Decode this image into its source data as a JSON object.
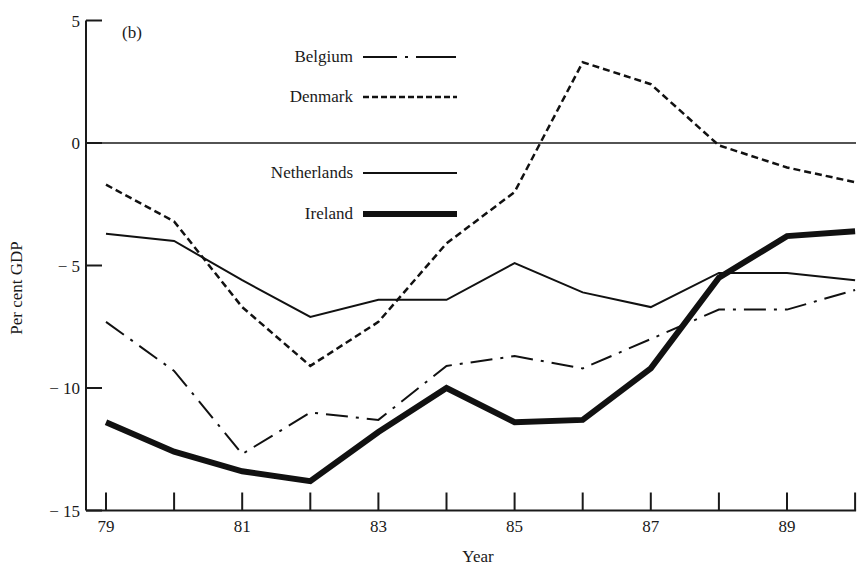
{
  "chart_data": {
    "type": "line",
    "panel_label": "(b)",
    "title": "",
    "xlabel": "Year",
    "ylabel": "Per cent GDP",
    "ylim": [
      -15,
      5
    ],
    "xlim": [
      79,
      90
    ],
    "yticks": [
      5,
      0,
      -5,
      -10,
      -15
    ],
    "ytick_labels": [
      "5",
      "0",
      "− 5",
      "− 10",
      "− 15"
    ],
    "xticks": [
      79,
      80,
      81,
      82,
      83,
      84,
      85,
      86,
      87,
      88,
      89,
      90
    ],
    "xtick_labels": {
      "79": "79",
      "81": "81",
      "83": "83",
      "85": "85",
      "87": "87",
      "89": "89"
    },
    "grid": false,
    "zero_line": true,
    "legend_position": "upper-left-inside",
    "x": [
      79,
      80,
      81,
      82,
      83,
      84,
      85,
      86,
      87,
      88,
      89,
      90
    ],
    "series": [
      {
        "name": "Belgium",
        "style": "dash-dot",
        "width": 2,
        "values": [
          -7.3,
          -9.3,
          -12.7,
          -11.0,
          -11.3,
          -9.1,
          -8.7,
          -9.2,
          -8.0,
          -6.8,
          -6.8,
          -6.0
        ]
      },
      {
        "name": "Denmark",
        "style": "dashed",
        "width": 2.5,
        "values": [
          -1.7,
          -3.2,
          -6.7,
          -9.1,
          -7.3,
          -4.1,
          -2.0,
          3.3,
          2.4,
          -0.1,
          -1.0,
          -1.6
        ]
      },
      {
        "name": "Netherlands",
        "style": "solid",
        "width": 2,
        "values": [
          -3.7,
          -4.0,
          -5.6,
          -7.1,
          -6.4,
          -6.4,
          -4.9,
          -6.1,
          -6.7,
          -5.3,
          -5.3,
          -5.6
        ]
      },
      {
        "name": "Ireland",
        "style": "solid-thick",
        "width": 6,
        "values": [
          -11.4,
          -12.6,
          -13.4,
          -13.8,
          -11.8,
          -10.0,
          -11.4,
          -11.3,
          -9.2,
          -5.5,
          -3.8,
          -3.6
        ]
      }
    ]
  }
}
